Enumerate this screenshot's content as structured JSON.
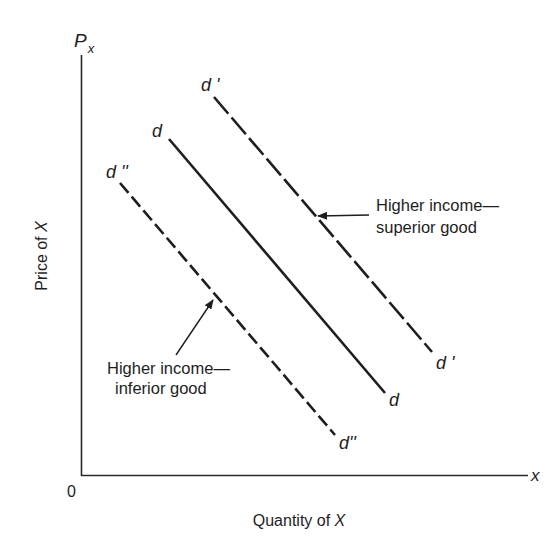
{
  "diagram": {
    "type": "economics-demand-shift",
    "axes": {
      "y_symbol": "P",
      "y_subscript": "x",
      "y_label_prefix": "Price of ",
      "y_label_var": "X",
      "x_symbol": "x",
      "x_label_prefix": "Quantity of ",
      "x_label_var": "X",
      "origin_label": "0"
    },
    "curves": [
      {
        "id": "d-prime",
        "name": "d'",
        "style": "long-dash",
        "label_top": "d '",
        "label_bottom": "d '"
      },
      {
        "id": "d",
        "name": "d",
        "style": "solid",
        "label_top": "d",
        "label_bottom": "d"
      },
      {
        "id": "d-double-prime",
        "name": "d''",
        "style": "short-dash",
        "label_top": "d ''",
        "label_bottom": "d''"
      }
    ],
    "annotations": [
      {
        "id": "superior",
        "line1": "Higher income—",
        "line2": "superior good",
        "points_to": "d'"
      },
      {
        "id": "inferior",
        "line1": "Higher income—",
        "line2": "inferior good",
        "points_to": "d''"
      }
    ],
    "colors": {
      "ink": "#1e1e1e",
      "background": "#ffffff"
    }
  }
}
